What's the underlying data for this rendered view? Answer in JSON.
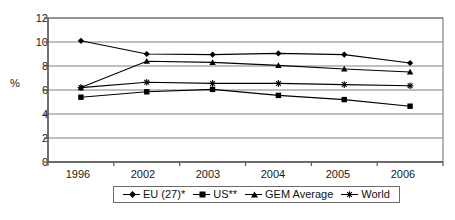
{
  "chart_data": {
    "type": "line",
    "title": "",
    "xlabel": "",
    "ylabel": "%",
    "categories": [
      "1996",
      "2002",
      "2003",
      "2004",
      "2005",
      "2006"
    ],
    "ylim": [
      0,
      12
    ],
    "ytick_values": [
      0,
      2,
      4,
      6,
      8,
      10,
      12
    ],
    "ytick_labels": [
      "0",
      "2",
      "4",
      "6",
      "8",
      "10",
      "12"
    ],
    "grid": "horizontal",
    "legend_position": "bottom",
    "series": [
      {
        "name": "EU (27)*",
        "marker": "diamond",
        "color": "#000000",
        "values": [
          10.1,
          9.0,
          8.95,
          9.05,
          8.95,
          8.25
        ]
      },
      {
        "name": "US**",
        "marker": "square",
        "color": "#000000",
        "values": [
          5.4,
          5.85,
          6.05,
          5.55,
          5.2,
          4.65
        ]
      },
      {
        "name": "GEM Average",
        "marker": "triangle",
        "color": "#000000",
        "values": [
          6.2,
          8.4,
          8.3,
          8.05,
          7.75,
          7.5
        ]
      },
      {
        "name": "World",
        "marker": "star",
        "color": "#000000",
        "values": [
          6.2,
          6.65,
          6.55,
          6.55,
          6.45,
          6.35
        ]
      }
    ]
  },
  "plot": {
    "border_color": "#6b6b6b",
    "grid_color": "#808080",
    "axis_color": "#555555",
    "background": "#ffffff"
  }
}
